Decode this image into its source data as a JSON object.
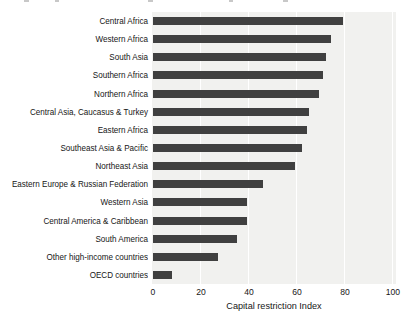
{
  "chart_data": {
    "type": "bar",
    "orientation": "horizontal",
    "title": "",
    "xlabel": "Capital restriction Index",
    "ylabel": "",
    "xlim": [
      0,
      100
    ],
    "xticks": [
      0,
      20,
      40,
      60,
      80,
      100
    ],
    "grid": true,
    "legend": false,
    "categories": [
      "Central Africa",
      "Western Africa",
      "South Asia",
      "Southern Africa",
      "Northern Africa",
      "Central Asia, Caucasus & Turkey",
      "Eastern Africa",
      "Southeast Asia & Pacific",
      "Northeast Asia",
      "Eastern Europe & Russian Federation",
      "Western Asia",
      "Central America & Caribbean",
      "South America",
      "Other high-income countries",
      "OECD countries"
    ],
    "values": [
      79,
      74,
      72,
      71,
      69,
      65,
      64,
      62,
      59,
      46,
      39,
      39,
      35,
      27,
      8
    ],
    "colors": {
      "bar": "#404040",
      "panel_bg": "#f1f1ef",
      "gridline": "#ffffff",
      "text": "#161616"
    }
  }
}
